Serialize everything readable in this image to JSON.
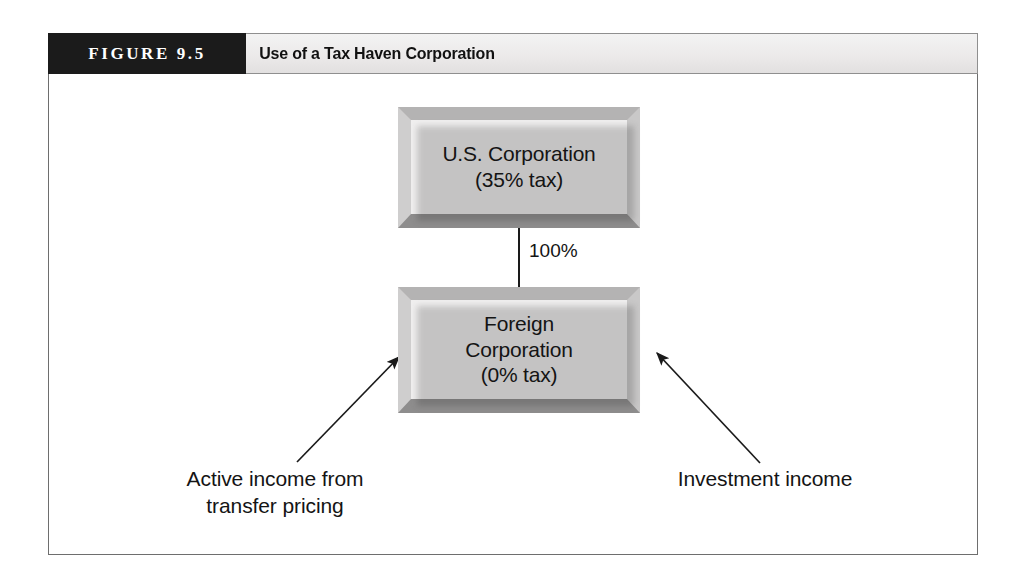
{
  "figure": {
    "number_label": "FIGURE 9.5",
    "title": "Use of a Tax Haven Corporation"
  },
  "diagram": {
    "type": "flow-diagram",
    "nodes": [
      {
        "id": "us-corporation",
        "label": "U.S. Corporation\n(35% tax)",
        "tax_rate": "35%"
      },
      {
        "id": "foreign-corporation",
        "label": "Foreign\nCorporation\n(0% tax)",
        "tax_rate": "0%"
      }
    ],
    "connector": {
      "from": "us-corporation",
      "to": "foreign-corporation",
      "label": "100%"
    },
    "inflows": [
      {
        "id": "active-income",
        "label": "Active income from\ntransfer pricing",
        "target": "foreign-corporation",
        "side": "left"
      },
      {
        "id": "investment-income",
        "label": "Investment income",
        "target": "foreign-corporation",
        "side": "right"
      }
    ]
  },
  "colors": {
    "header_black": "#1b1b1b",
    "header_gray": "#eceaea",
    "box_face": "#f0efef",
    "bevel_top": "#b4b3b3",
    "bevel_bottom": "#8e8d8d",
    "frame_border": "#6e6e6e",
    "text": "#141414"
  }
}
